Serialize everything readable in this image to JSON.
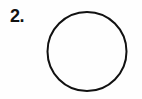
{
  "figure": {
    "item_number_label": "2.",
    "background_color": "#fefefe",
    "ink_color": "#111111",
    "canvas": {
      "width": 142,
      "height": 99
    },
    "shape": {
      "name": "circle",
      "fill": "none",
      "stroke_color": "#111111",
      "stroke_width": 2,
      "center_x": 87,
      "center_y": 51.5,
      "radius": 39.5
    }
  }
}
